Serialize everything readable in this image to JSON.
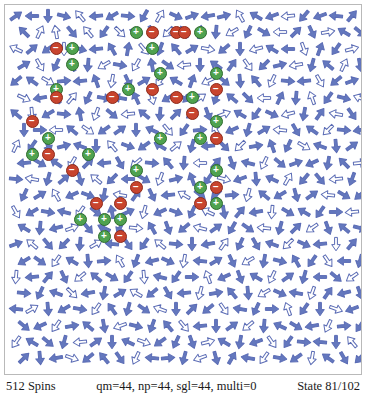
{
  "app": {
    "title": "Spin Lattice Viewer"
  },
  "statusbar": {
    "spins_label": "512 Spins",
    "params_label": "qm=44, np=44, sgl=44, multi=0",
    "state_label": "State 81/102"
  },
  "legend": {
    "plus_glyph": "+",
    "minus_glyph": "−",
    "arrow_icon": "spin-arrow-icon",
    "plus_icon": "positive-charge-icon",
    "minus_icon": "negative-charge-icon"
  },
  "colors": {
    "arrow_stroke": "#5b6cb5",
    "arrow_fill_solid": "#6478be",
    "arrow_fill_open": "#ffffff",
    "charge_plus": "#4fa24f",
    "charge_plus_border": "#2e6b2e",
    "charge_minus": "#c8442e",
    "charge_minus_border": "#8e2a1a",
    "panel_background": "#ffffff",
    "panel_border": "#b9b9b9",
    "text": "#1a1a1a"
  },
  "lattice": {
    "columns": 22,
    "rows": 22,
    "cell_width": 16.0,
    "cell_height": 16.3,
    "origin_x": 11,
    "origin_y": 11,
    "total_spins": 512,
    "angles": [
      [
        55,
        270,
        180,
        105,
        320,
        265,
        240,
        95,
        210,
        30,
        115,
        70,
        260,
        75,
        330,
        300,
        250,
        265,
        220,
        250,
        275,
        40
      ],
      [
        315,
        25,
        350,
        140,
        320,
        215,
        135,
        290,
        155,
        225,
        330,
        10,
        185,
        240,
        205,
        120,
        270,
        45,
        155,
        80,
        300,
        130
      ],
      [
        295,
        50,
        235,
        180,
        105,
        265,
        330,
        10,
        140,
        200,
        320,
        60,
        100,
        230,
        180,
        255,
        300,
        270,
        160,
        20,
        215,
        75
      ],
      [
        60,
        150,
        205,
        335,
        185,
        240,
        100,
        210,
        350,
        125,
        265,
        180,
        305,
        35,
        145,
        225,
        75,
        260,
        195,
        310,
        25,
        170
      ],
      [
        230,
        305,
        120,
        85,
        265,
        340,
        190,
        155,
        60,
        215,
        300,
        20,
        245,
        130,
        175,
        320,
        205,
        95,
        265,
        150,
        230,
        70
      ],
      [
        115,
        260,
        320,
        40,
        205,
        100,
        280,
        335,
        165,
        240,
        115,
        55,
        200,
        310,
        135,
        270,
        25,
        185,
        340,
        215,
        105,
        290
      ],
      [
        310,
        175,
        240,
        95,
        350,
        200,
        130,
        265,
        310,
        185,
        45,
        235,
        160,
        70,
        300,
        215,
        115,
        255,
        190,
        35,
        280,
        145
      ],
      [
        180,
        90,
        270,
        310,
        125,
        235,
        55,
        180,
        295,
        140,
        215,
        85,
        330,
        245,
        195,
        60,
        275,
        150,
        305,
        225,
        95,
        260
      ],
      [
        25,
        215,
        160,
        75,
        290,
        180,
        320,
        110,
        235,
        300,
        50,
        195,
        265,
        135,
        225,
        80,
        340,
        205,
        120,
        290,
        175,
        55
      ],
      [
        265,
        120,
        305,
        210,
        45,
        265,
        150,
        230,
        95,
        320,
        185,
        270,
        40,
        160,
        285,
        205,
        130,
        70,
        245,
        190,
        315,
        85
      ],
      [
        95,
        280,
        195,
        50,
        165,
        310,
        225,
        270,
        120,
        200,
        75,
        340,
        215,
        105,
        250,
        175,
        295,
        30,
        220,
        140,
        265,
        200
      ],
      [
        205,
        60,
        330,
        245,
        110,
        190,
        280,
        35,
        155,
        265,
        300,
        130,
        225,
        85,
        195,
        310,
        240,
        165,
        55,
        275,
        120,
        230
      ],
      [
        150,
        240,
        100,
        285,
        215,
        130,
        350,
        65,
        195,
        245,
        110,
        205,
        295,
        170,
        40,
        260,
        185,
        120,
        300,
        215,
        90,
        265
      ],
      [
        300,
        185,
        255,
        70,
        140,
        295,
        205,
        95,
        330,
        160,
        230,
        285,
        55,
        210,
        125,
        275,
        195,
        45,
        235,
        160,
        310,
        105
      ],
      [
        70,
        310,
        140,
        225,
        185,
        60,
        275,
        145,
        215,
        310,
        95,
        180,
        260,
        35,
        205,
        150,
        290,
        225,
        115,
        265,
        180,
        40
      ],
      [
        240,
        125,
        215,
        300,
        175,
        85,
        330,
        200,
        255,
        115,
        190,
        275,
        60,
        155,
        240,
        190,
        105,
        330,
        215,
        145,
        270,
        195
      ],
      [
        185,
        265,
        40,
        155,
        230,
        310,
        120,
        215,
        175,
        285,
        215,
        90,
        340,
        245,
        160,
        300,
        205,
        55,
        195,
        270,
        130,
        235
      ],
      [
        95,
        205,
        290,
        135,
        260,
        190,
        60,
        300,
        230,
        150,
        265,
        195,
        80,
        320,
        175,
        240,
        115,
        280,
        200,
        35,
        255,
        160
      ],
      [
        275,
        60,
        175,
        240,
        100,
        215,
        325,
        195,
        125,
        290,
        180,
        45,
        230,
        145,
        280,
        205,
        90,
        340,
        215,
        180,
        110,
        250
      ],
      [
        130,
        245,
        215,
        80,
        310,
        170,
        250,
        105,
        200,
        320,
        140,
        265,
        180,
        55,
        230,
        185,
        295,
        120,
        260,
        205,
        85,
        215
      ],
      [
        215,
        300,
        130,
        195,
        265,
        55,
        180,
        295,
        110,
        235,
        205,
        160,
        75,
        300,
        190,
        250,
        145,
        215,
        95,
        275,
        180,
        320
      ],
      [
        45,
        175,
        260,
        110,
        230,
        320,
        145,
        205,
        275,
        85,
        195,
        250,
        165,
        30,
        280,
        215,
        100,
        235,
        190,
        305,
        150,
        225
      ]
    ],
    "open_arrow_cells": [
      [
        0,
        4
      ],
      [
        0,
        9
      ],
      [
        0,
        14
      ],
      [
        0,
        17
      ],
      [
        1,
        1
      ],
      [
        1,
        2
      ],
      [
        1,
        4
      ],
      [
        1,
        6
      ],
      [
        1,
        9
      ],
      [
        1,
        11
      ],
      [
        1,
        13
      ],
      [
        1,
        16
      ],
      [
        1,
        19
      ],
      [
        2,
        0
      ],
      [
        2,
        3
      ],
      [
        2,
        8
      ],
      [
        2,
        12
      ],
      [
        2,
        15
      ],
      [
        2,
        18
      ],
      [
        2,
        21
      ],
      [
        3,
        1
      ],
      [
        3,
        5
      ],
      [
        3,
        7
      ],
      [
        3,
        10
      ],
      [
        3,
        14
      ],
      [
        3,
        17
      ],
      [
        3,
        20
      ],
      [
        4,
        2
      ],
      [
        4,
        6
      ],
      [
        4,
        9
      ],
      [
        4,
        12
      ],
      [
        4,
        16
      ],
      [
        4,
        19
      ],
      [
        5,
        0
      ],
      [
        5,
        3
      ],
      [
        5,
        8
      ],
      [
        5,
        11
      ],
      [
        5,
        15
      ],
      [
        5,
        18
      ],
      [
        5,
        21
      ],
      [
        6,
        1
      ],
      [
        6,
        5
      ],
      [
        6,
        7
      ],
      [
        6,
        13
      ],
      [
        6,
        17
      ],
      [
        6,
        20
      ],
      [
        7,
        2
      ],
      [
        7,
        4
      ],
      [
        7,
        9
      ],
      [
        7,
        12
      ],
      [
        7,
        16
      ],
      [
        7,
        19
      ],
      [
        8,
        0
      ],
      [
        8,
        6
      ],
      [
        8,
        10
      ],
      [
        8,
        14
      ],
      [
        8,
        18
      ],
      [
        9,
        3
      ],
      [
        9,
        7
      ],
      [
        9,
        11
      ],
      [
        9,
        15
      ],
      [
        9,
        21
      ],
      [
        10,
        1
      ],
      [
        10,
        5
      ],
      [
        10,
        9
      ],
      [
        10,
        13
      ],
      [
        10,
        17
      ],
      [
        10,
        20
      ],
      [
        11,
        2
      ],
      [
        11,
        6
      ],
      [
        11,
        10
      ],
      [
        11,
        14
      ],
      [
        11,
        19
      ],
      [
        12,
        0
      ],
      [
        12,
        4
      ],
      [
        12,
        8
      ],
      [
        12,
        12
      ],
      [
        12,
        16
      ],
      [
        12,
        21
      ],
      [
        13,
        3
      ],
      [
        13,
        7
      ],
      [
        13,
        11
      ],
      [
        13,
        15
      ],
      [
        13,
        18
      ],
      [
        14,
        1
      ],
      [
        14,
        5
      ],
      [
        14,
        9
      ],
      [
        14,
        13
      ],
      [
        14,
        17
      ],
      [
        14,
        20
      ],
      [
        15,
        2
      ],
      [
        15,
        6
      ],
      [
        15,
        10
      ],
      [
        15,
        14
      ],
      [
        15,
        19
      ],
      [
        16,
        0
      ],
      [
        16,
        4
      ],
      [
        16,
        8
      ],
      [
        16,
        12
      ],
      [
        16,
        16
      ],
      [
        16,
        21
      ],
      [
        17,
        3
      ],
      [
        17,
        7
      ],
      [
        17,
        11
      ],
      [
        17,
        15
      ],
      [
        17,
        18
      ],
      [
        18,
        1
      ],
      [
        18,
        5
      ],
      [
        18,
        9
      ],
      [
        18,
        13
      ],
      [
        18,
        17
      ],
      [
        18,
        20
      ],
      [
        19,
        2
      ],
      [
        19,
        6
      ],
      [
        19,
        10
      ],
      [
        19,
        14
      ],
      [
        19,
        19
      ],
      [
        20,
        0
      ],
      [
        20,
        4
      ],
      [
        20,
        8
      ],
      [
        20,
        12
      ],
      [
        20,
        16
      ],
      [
        20,
        21
      ],
      [
        21,
        3
      ],
      [
        21,
        7
      ],
      [
        21,
        11
      ],
      [
        21,
        15
      ],
      [
        21,
        18
      ]
    ],
    "charges": [
      {
        "type": "plus",
        "col": 15,
        "row": 2
      },
      {
        "type": "minus",
        "col": 17,
        "row": 2
      },
      {
        "type": "minus",
        "col": 20,
        "row": 2
      },
      {
        "type": "minus",
        "col": 21,
        "row": 2
      },
      {
        "type": "plus",
        "col": 23,
        "row": 2
      },
      {
        "type": "minus",
        "col": 5,
        "row": 4
      },
      {
        "type": "plus",
        "col": 7,
        "row": 4
      },
      {
        "type": "plus",
        "col": 17,
        "row": 4
      },
      {
        "type": "plus",
        "col": 7,
        "row": 6
      },
      {
        "type": "plus",
        "col": 18,
        "row": 7
      },
      {
        "type": "plus",
        "col": 25,
        "row": 7
      },
      {
        "type": "plus",
        "col": 5,
        "row": 9
      },
      {
        "type": "plus",
        "col": 14,
        "row": 9
      },
      {
        "type": "minus",
        "col": 17,
        "row": 9
      },
      {
        "type": "minus",
        "col": 25,
        "row": 9
      },
      {
        "type": "minus",
        "col": 5,
        "row": 10
      },
      {
        "type": "minus",
        "col": 12,
        "row": 10
      },
      {
        "type": "minus",
        "col": 20,
        "row": 10
      },
      {
        "type": "plus",
        "col": 22,
        "row": 10
      },
      {
        "type": "minus",
        "col": 22,
        "row": 12
      },
      {
        "type": "minus",
        "col": 2,
        "row": 13
      },
      {
        "type": "plus",
        "col": 25,
        "row": 13
      },
      {
        "type": "plus",
        "col": 4,
        "row": 15
      },
      {
        "type": "plus",
        "col": 18,
        "row": 15
      },
      {
        "type": "plus",
        "col": 23,
        "row": 15
      },
      {
        "type": "minus",
        "col": 25,
        "row": 15
      },
      {
        "type": "plus",
        "col": 2,
        "row": 17
      },
      {
        "type": "minus",
        "col": 4,
        "row": 17
      },
      {
        "type": "plus",
        "col": 9,
        "row": 17
      },
      {
        "type": "minus",
        "col": 7,
        "row": 19
      },
      {
        "type": "plus",
        "col": 15,
        "row": 19
      },
      {
        "type": "plus",
        "col": 25,
        "row": 19
      },
      {
        "type": "minus",
        "col": 15,
        "row": 21
      },
      {
        "type": "plus",
        "col": 23,
        "row": 21
      },
      {
        "type": "minus",
        "col": 25,
        "row": 21
      },
      {
        "type": "minus",
        "col": 10,
        "row": 23
      },
      {
        "type": "minus",
        "col": 13,
        "row": 23
      },
      {
        "type": "minus",
        "col": 23,
        "row": 23
      },
      {
        "type": "plus",
        "col": 25,
        "row": 23
      },
      {
        "type": "plus",
        "col": 8,
        "row": 25
      },
      {
        "type": "plus",
        "col": 11,
        "row": 25
      },
      {
        "type": "plus",
        "col": 13,
        "row": 25
      },
      {
        "type": "plus",
        "col": 11,
        "row": 27
      },
      {
        "type": "minus",
        "col": 13,
        "row": 27
      }
    ]
  }
}
